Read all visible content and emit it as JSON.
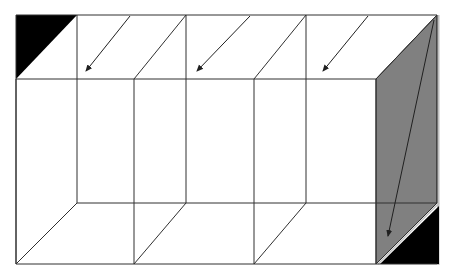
{
  "diagram": {
    "title": "",
    "width": 452,
    "height": 278,
    "colors": {
      "line": "#202020",
      "face_fill": "#808080",
      "corner_fill": "#000000",
      "edge_highlight": "#c0c0c0",
      "background": "#ffffff"
    },
    "front_rect": {
      "x1": 16,
      "y1": 79,
      "x2": 376,
      "y2": 264
    },
    "back_top_y": 15,
    "back_bottom_y": 203,
    "back_left_x": 16,
    "back_right_x": 437,
    "front_verticals": [
      16,
      134,
      254,
      376
    ],
    "back_verticals": [
      77,
      186,
      306,
      437
    ],
    "arrows": [
      {
        "from": [
          130,
          16
        ],
        "to": [
          86,
          71
        ]
      },
      {
        "from": [
          250,
          16
        ],
        "to": [
          197,
          71
        ]
      },
      {
        "from": [
          368,
          16
        ],
        "to": [
          323,
          71
        ]
      },
      {
        "from": [
          434,
          20
        ],
        "to": [
          388,
          236
        ]
      }
    ],
    "shaded_side_face": [
      [
        376,
        79
      ],
      [
        437,
        15
      ],
      [
        437,
        203
      ],
      [
        376,
        264
      ]
    ],
    "corner_triangles": [
      [
        [
          16,
          15
        ],
        [
          77,
          15
        ],
        [
          16,
          79
        ]
      ],
      [
        [
          439,
          206
        ],
        [
          439,
          264
        ],
        [
          380,
          264
        ]
      ]
    ]
  }
}
